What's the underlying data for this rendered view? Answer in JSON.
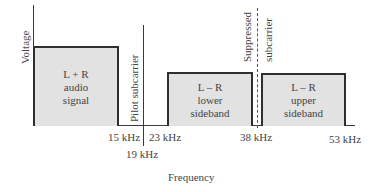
{
  "diagram": {
    "type": "frequency-spectrum",
    "y_axis_label": "Voltage",
    "x_axis_label": "Frequency",
    "blocks": [
      {
        "id": "lr-sum",
        "lines": [
          "L + R",
          "audio",
          "signal"
        ],
        "from_khz": 0,
        "to_khz": 15
      },
      {
        "id": "lower-sideband",
        "lines": [
          "L – R",
          "lower",
          "sideband"
        ],
        "from_khz": 23,
        "to_khz": 38
      },
      {
        "id": "upper-sideband",
        "lines": [
          "L – R",
          "upper",
          "sideband"
        ],
        "from_khz": 38,
        "to_khz": 53
      }
    ],
    "markers": [
      {
        "id": "pilot",
        "label": "Pilot subcarrier",
        "khz": 19,
        "style": "solid"
      },
      {
        "id": "suppressed",
        "label_top": "Suppressed",
        "label_bottom": "subcarrier",
        "khz": 38,
        "style": "dashed"
      }
    ],
    "ticks": [
      "15 kHz",
      "19 kHz",
      "23 kHz",
      "38 kHz",
      "53 kHz"
    ]
  }
}
